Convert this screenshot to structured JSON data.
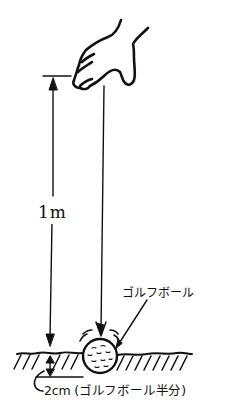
{
  "diagram": {
    "title": "",
    "labels": {
      "drop_height": "1m",
      "ball": "ゴルフボール",
      "depth": "2cm (ゴルフボール半分)"
    },
    "elements": {
      "hand": "hand releasing ball",
      "height_dimension": "vertical dimension arrow from fingertip level to ground",
      "drop_line": "vertical arrow showing ball fall path",
      "ball": "golf ball half-buried in ground",
      "ground": "hatched ground surface",
      "depth_dimension": "small double arrow showing burial depth"
    },
    "colors": {
      "ink": "#111111",
      "background": "#ffffff"
    }
  }
}
